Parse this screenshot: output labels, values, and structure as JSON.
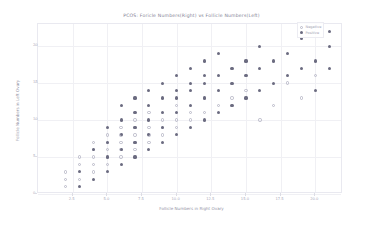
{
  "chart_data": {
    "type": "scatter",
    "title": "PCOS: Foricle Numbers(Right) vs Follicle Numbers(Left)",
    "xlabel": "Follicle Numbers in Right Ovary",
    "ylabel": "Follicle Numbers in Left Ovary",
    "xlim": [
      0,
      22
    ],
    "ylim": [
      0,
      23
    ],
    "grid": true,
    "legend_position": "top-right",
    "xticks": [
      "2.5",
      "5.0",
      "7.5",
      "10.0",
      "12.5",
      "15.0",
      "17.5",
      "20.0"
    ],
    "xtick_values": [
      2.5,
      5.0,
      7.5,
      10.0,
      12.5,
      15.0,
      17.5,
      20.0
    ],
    "yticks": [
      "0",
      "5",
      "10",
      "15",
      "20"
    ],
    "ytick_values": [
      0,
      5,
      10,
      15,
      20
    ],
    "series": [
      {
        "name": "Negative",
        "marker": "open-circle",
        "color": "#b9b9c8",
        "points": [
          [
            2,
            1
          ],
          [
            2,
            2
          ],
          [
            2,
            3
          ],
          [
            3,
            2
          ],
          [
            3,
            4
          ],
          [
            3,
            5
          ],
          [
            4,
            3
          ],
          [
            4,
            4
          ],
          [
            4,
            5
          ],
          [
            4,
            6
          ],
          [
            4,
            7
          ],
          [
            5,
            4
          ],
          [
            5,
            5
          ],
          [
            5,
            6
          ],
          [
            5,
            7
          ],
          [
            5,
            8
          ],
          [
            6,
            5
          ],
          [
            6,
            6
          ],
          [
            6,
            7
          ],
          [
            6,
            8
          ],
          [
            6,
            9
          ],
          [
            7,
            6
          ],
          [
            7,
            7
          ],
          [
            7,
            8
          ],
          [
            7,
            9
          ],
          [
            7,
            10
          ],
          [
            8,
            7
          ],
          [
            8,
            8
          ],
          [
            8,
            9
          ],
          [
            8,
            11
          ],
          [
            9,
            8
          ],
          [
            9,
            9
          ],
          [
            9,
            10
          ],
          [
            10,
            9
          ],
          [
            10,
            10
          ],
          [
            10,
            12
          ],
          [
            11,
            10
          ],
          [
            11,
            11
          ],
          [
            12,
            11
          ],
          [
            12,
            13
          ],
          [
            13,
            12
          ],
          [
            14,
            13
          ],
          [
            15,
            14
          ],
          [
            16,
            10
          ],
          [
            17,
            12
          ],
          [
            18,
            15
          ],
          [
            19,
            13
          ],
          [
            20,
            16
          ]
        ]
      },
      {
        "name": "Positive",
        "marker": "filled-circle",
        "color": "#6b6b80",
        "points": [
          [
            3,
            1
          ],
          [
            3,
            3
          ],
          [
            4,
            2
          ],
          [
            4,
            6
          ],
          [
            5,
            3
          ],
          [
            5,
            5
          ],
          [
            5,
            7
          ],
          [
            5,
            9
          ],
          [
            6,
            4
          ],
          [
            6,
            6
          ],
          [
            6,
            8
          ],
          [
            6,
            10
          ],
          [
            6,
            12
          ],
          [
            7,
            5
          ],
          [
            7,
            7
          ],
          [
            7,
            9
          ],
          [
            7,
            11
          ],
          [
            7,
            13
          ],
          [
            8,
            6
          ],
          [
            8,
            8
          ],
          [
            8,
            10
          ],
          [
            8,
            12
          ],
          [
            8,
            14
          ],
          [
            9,
            7
          ],
          [
            9,
            9
          ],
          [
            9,
            11
          ],
          [
            9,
            13
          ],
          [
            9,
            15
          ],
          [
            10,
            8
          ],
          [
            10,
            11
          ],
          [
            10,
            13
          ],
          [
            10,
            14
          ],
          [
            10,
            16
          ],
          [
            11,
            9
          ],
          [
            11,
            12
          ],
          [
            11,
            14
          ],
          [
            11,
            15
          ],
          [
            11,
            17
          ],
          [
            12,
            10
          ],
          [
            12,
            13
          ],
          [
            12,
            15
          ],
          [
            12,
            16
          ],
          [
            12,
            18
          ],
          [
            13,
            11
          ],
          [
            13,
            14
          ],
          [
            13,
            16
          ],
          [
            13,
            19
          ],
          [
            14,
            12
          ],
          [
            14,
            15
          ],
          [
            14,
            17
          ],
          [
            15,
            13
          ],
          [
            15,
            16
          ],
          [
            15,
            18
          ],
          [
            16,
            14
          ],
          [
            16,
            17
          ],
          [
            16,
            20
          ],
          [
            17,
            15
          ],
          [
            17,
            18
          ],
          [
            18,
            16
          ],
          [
            18,
            19
          ],
          [
            19,
            17
          ],
          [
            19,
            21
          ],
          [
            20,
            14
          ],
          [
            20,
            18
          ],
          [
            21,
            20
          ],
          [
            21,
            22
          ],
          [
            21,
            17
          ]
        ]
      }
    ]
  }
}
